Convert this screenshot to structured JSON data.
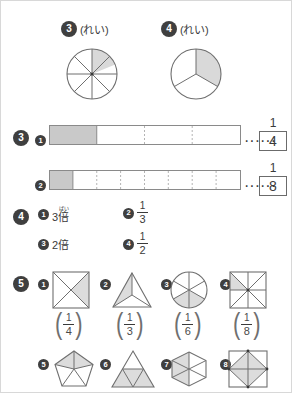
{
  "colors": {
    "stroke": "#6f6f6f",
    "shade": "#d9d9d9",
    "badge_bg": "#3f3f3f",
    "text": "#3a3a3a",
    "bar_shade": "#c9c9c9",
    "dotted": "#b4b4b4"
  },
  "section_examples": {
    "items": [
      {
        "number": "3",
        "note": "(れい)",
        "shape": "circle",
        "parts": 8,
        "shaded": 1,
        "fraction": "1/8"
      },
      {
        "number": "4",
        "note": "(れい)",
        "shape": "circle",
        "parts": 3,
        "shaded": 1,
        "fraction": "1/3"
      }
    ]
  },
  "section3": {
    "number": "3",
    "rows": [
      {
        "number": "1",
        "parts": 4,
        "shaded": 1,
        "dots": "······",
        "answer_numerator": "1",
        "answer_denominator": "4"
      },
      {
        "number": "2",
        "parts": 8,
        "shaded": 1,
        "dots": "······",
        "answer_numerator": "1",
        "answer_denominator": "8"
      }
    ]
  },
  "section4": {
    "number": "4",
    "answers": [
      {
        "number": "1",
        "type": "text",
        "value": "3倍",
        "ruby_base": "倍",
        "ruby_text": "ばい",
        "prefix": "3"
      },
      {
        "number": "2",
        "type": "fraction",
        "numerator": "1",
        "denominator": "3"
      },
      {
        "number": "3",
        "type": "text",
        "value": "2倍",
        "prefix": "2",
        "plain": "2倍"
      },
      {
        "number": "4",
        "type": "fraction",
        "numerator": "1",
        "denominator": "2"
      }
    ]
  },
  "section5": {
    "number": "5",
    "row1": [
      {
        "number": "1",
        "shape": "square-diagonals",
        "parts": 4,
        "shaded": 1,
        "answer_numerator": "1",
        "answer_denominator": "4"
      },
      {
        "number": "2",
        "shape": "triangle-3",
        "parts": 3,
        "shaded": 1,
        "answer_numerator": "1",
        "answer_denominator": "3"
      },
      {
        "number": "3",
        "shape": "circle-6",
        "parts": 6,
        "shaded": 1,
        "answer_numerator": "1",
        "answer_denominator": "6"
      },
      {
        "number": "4",
        "shape": "square-8",
        "parts": 8,
        "shaded": 1,
        "answer_numerator": "1",
        "answer_denominator": "8"
      }
    ],
    "row2": [
      {
        "number": "5",
        "shape": "pentagon-5",
        "parts": 5,
        "shaded": 2
      },
      {
        "number": "6",
        "shape": "triangle-4",
        "parts": 4,
        "shaded": 3
      },
      {
        "number": "7",
        "shape": "hexagon-6",
        "parts": 6,
        "shaded": 3
      },
      {
        "number": "8",
        "shape": "square-inscribed",
        "parts": 8,
        "shaded": 4
      }
    ]
  }
}
